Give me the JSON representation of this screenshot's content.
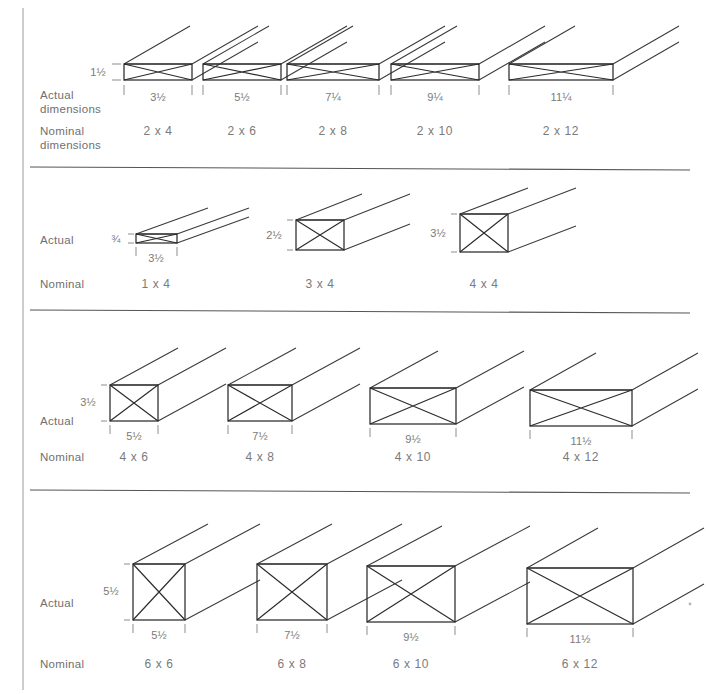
{
  "figure": {
    "ink_color": "#2b2b2b",
    "text_color": "#7a7a7a",
    "background": "#ffffff"
  },
  "row_label_terms": {
    "actual": "Actual",
    "actual_second_line": "dimensions",
    "nominal": "Nominal",
    "nominal_second_line": "dimensions"
  },
  "rows": [
    {
      "id": "row-2x",
      "actual_label": "Actual",
      "actual_label_line2": "dimensions",
      "nominal_label": "Nominal",
      "nominal_label_line2": "dimensions",
      "height_label": "1½",
      "items": [
        {
          "nominal": "2 x 4",
          "actual_width": "3½",
          "actual_height": "1½"
        },
        {
          "nominal": "2 x 6",
          "actual_width": "5½",
          "actual_height": "1½"
        },
        {
          "nominal": "2 x 8",
          "actual_width": "7¼",
          "actual_height": "1½"
        },
        {
          "nominal": "2 x 10",
          "actual_width": "9¼",
          "actual_height": "1½"
        },
        {
          "nominal": "2 x 12",
          "actual_width": "11¼",
          "actual_height": "1½"
        }
      ]
    },
    {
      "id": "row-mixed",
      "actual_label": "Actual",
      "actual_label_line2": "",
      "nominal_label": "Nominal",
      "nominal_label_line2": "",
      "items": [
        {
          "nominal": "1 x 4",
          "actual_width": "3½",
          "actual_height": "¾"
        },
        {
          "nominal": "3 x 4",
          "actual_width": "",
          "actual_height": "2½"
        },
        {
          "nominal": "4 x 4",
          "actual_width": "",
          "actual_height": "3½"
        }
      ]
    },
    {
      "id": "row-4x",
      "actual_label": "Actual",
      "actual_label_line2": "",
      "nominal_label": "Nominal",
      "nominal_label_line2": "",
      "height_label": "3½",
      "items": [
        {
          "nominal": "4 x 6",
          "actual_width": "5½",
          "actual_height": "3½"
        },
        {
          "nominal": "4 x 8",
          "actual_width": "7½",
          "actual_height": "3½"
        },
        {
          "nominal": "4 x 10",
          "actual_width": "9½",
          "actual_height": "3½"
        },
        {
          "nominal": "4 x 12",
          "actual_width": "11½",
          "actual_height": "3½"
        }
      ]
    },
    {
      "id": "row-6x",
      "actual_label": "Actual",
      "actual_label_line2": "",
      "nominal_label": "Nominal",
      "nominal_label_line2": "",
      "height_label": "5½",
      "items": [
        {
          "nominal": "6 x 6",
          "actual_width": "5½",
          "actual_height": "5½"
        },
        {
          "nominal": "6 x 8",
          "actual_width": "7½",
          "actual_height": "5½"
        },
        {
          "nominal": "6 x 10",
          "actual_width": "9½",
          "actual_height": "5½"
        },
        {
          "nominal": "6 x 12",
          "actual_width": "11½",
          "actual_height": "5½"
        }
      ]
    }
  ]
}
